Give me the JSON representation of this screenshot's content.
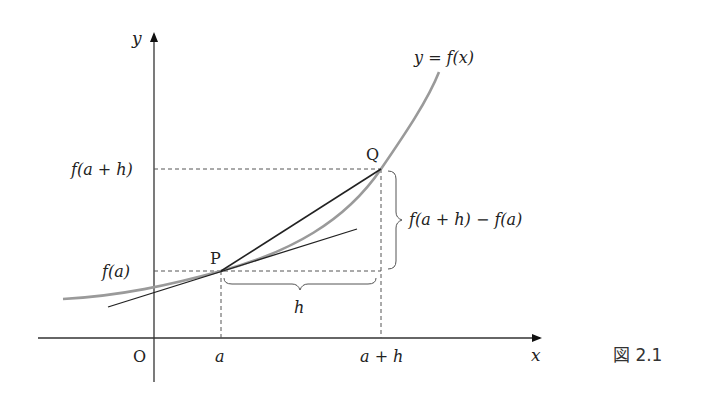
{
  "figure": {
    "caption": "図 2.1",
    "curve_label": "y = f(x)",
    "axes": {
      "x_label": "x",
      "y_label": "y",
      "origin_label": "O"
    },
    "points": {
      "P": "P",
      "Q": "Q"
    },
    "x_ticks": {
      "a": "a",
      "a_plus_h": "a + h"
    },
    "y_ticks": {
      "fa": "f(a)",
      "fah": "f(a + h)"
    },
    "brace_labels": {
      "h": "h",
      "diff": "f(a + h) − f(a)"
    },
    "colors": {
      "curve": "#9a9a9a",
      "lines": "#222222",
      "dashed": "#555555"
    }
  }
}
